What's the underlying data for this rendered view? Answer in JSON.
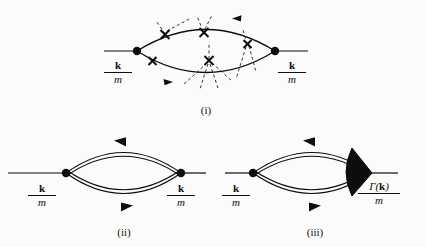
{
  "figure": {
    "background_color": "#fbfbfa",
    "ink_color": "#0d0d0d",
    "panels": [
      {
        "id": "i",
        "caption": "(i)",
        "line_style": "single",
        "left_vertex": "filled-dot",
        "right_vertex": "filled-dot",
        "left_label_num": "k",
        "left_label_den": "m",
        "right_label_num": "k",
        "right_label_den": "m",
        "impurity_crosses": 6,
        "dashed_interaction_lines": true,
        "top_arrow_direction": "left",
        "bottom_arrow_direction": "right"
      },
      {
        "id": "ii",
        "caption": "(ii)",
        "line_style": "double",
        "left_vertex": "filled-dot",
        "right_vertex": "filled-dot",
        "left_label_num": "k",
        "left_label_den": "m",
        "right_label_num": "k",
        "right_label_den": "m",
        "top_arrow_direction": "left",
        "bottom_arrow_direction": "right"
      },
      {
        "id": "iii",
        "caption": "(iii)",
        "line_style": "double",
        "left_vertex": "filled-dot",
        "right_vertex": "filled-wedge",
        "left_label_num": "k",
        "left_label_den": "m",
        "right_label_num": "Γ(k)",
        "right_label_den": "m",
        "right_label_k_bold": "k",
        "top_arrow_direction": "left",
        "bottom_arrow_direction": "right"
      }
    ]
  }
}
